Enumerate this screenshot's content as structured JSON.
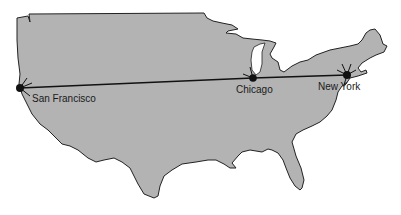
{
  "map": {
    "region": "Contiguous United States",
    "colors": {
      "land": "#b3b3b3",
      "outline": "#222222",
      "route": "#111111",
      "city": "#111111",
      "lake": "#ffffff"
    },
    "cities": [
      {
        "name": "San Francisco",
        "x": 20,
        "y": 88
      },
      {
        "name": "Chicago",
        "x": 253,
        "y": 78
      },
      {
        "name": "New York",
        "x": 347,
        "y": 75
      }
    ],
    "route": [
      "San Francisco",
      "Chicago",
      "New York"
    ]
  }
}
